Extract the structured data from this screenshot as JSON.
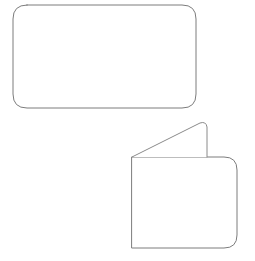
{
  "canvas": {
    "width": 255,
    "height": 261,
    "background_color": "#ffffff",
    "description": "Line drawing of two outlined white geometric shapes on a plain white background"
  },
  "style": {
    "stroke_color": "#7c7c7c",
    "stroke_color_secondary": "#8a8a8a",
    "fill_color": "#ffffff",
    "stroke_width": 1
  },
  "shapes": [
    {
      "name": "rounded-rectangle",
      "label": "Rounded rectangle",
      "type": "rounded-rect",
      "x": 13,
      "y": 5,
      "width": 183,
      "height": 103,
      "corner_radius": 14,
      "path": "M 27 5 L 182 5 Q 196 5 196 19 L 196 94 Q 196 108 182 108 L 27 108 Q 13 108 13 94 L 13 19 Q 13 5 27 5 Z"
    },
    {
      "name": "folded-card-body",
      "label": "Folded card body",
      "type": "rounded-rect-partial",
      "x": 132,
      "y": 157,
      "width": 105,
      "height": 91,
      "corner_radius": 13,
      "corners": {
        "top_left": "sharp",
        "top_right": "rounded",
        "bottom_right": "rounded",
        "bottom_left": "sharp"
      },
      "path": "M 132 157 L 224 157 Q 237 157 237 170 L 237 235 Q 237 248 224 248 L 132 248 Z"
    },
    {
      "name": "folded-card-flap",
      "label": "Folded card flap",
      "type": "triangle-flap",
      "apex_x": 206,
      "apex_y": 123,
      "path": "M 132 157 L 200 123 Q 206 121 207 127 L 207 157"
    }
  ]
}
